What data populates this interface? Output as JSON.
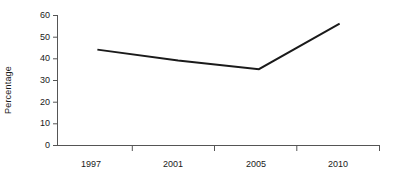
{
  "chart_data": {
    "type": "line",
    "title": "",
    "xlabel": "",
    "ylabel": "Percentage",
    "categories": [
      "1997",
      "2001",
      "2005",
      "2010"
    ],
    "values": [
      44,
      39,
      35,
      56
    ],
    "series": [
      {
        "name": "Percentage",
        "values": [
          44,
          39,
          35,
          56
        ],
        "color": "#1a1a1a"
      }
    ],
    "ylim": [
      0,
      60
    ],
    "yticks": [
      0,
      10,
      20,
      30,
      40,
      50,
      60
    ],
    "grid": false,
    "legend": false,
    "markers": false,
    "line_color": "#1a1a1a",
    "axis_color": "#555555",
    "background": "#ffffff"
  },
  "axes": {
    "y_title": "Percentage",
    "y_tick_labels": [
      "60",
      "50",
      "40",
      "30",
      "20",
      "10",
      "0"
    ],
    "x_tick_labels": [
      "1997",
      "2001",
      "2005",
      "2010"
    ]
  }
}
